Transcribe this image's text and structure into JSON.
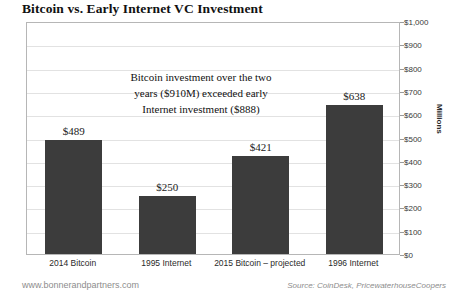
{
  "chart_data": {
    "type": "bar",
    "title": "Bitcoin vs. Early Internet VC Investment",
    "categories": [
      "2014 Bitcoin",
      "1995 Internet",
      "2015 Bitcoin – projected",
      "1996 Internet"
    ],
    "values": [
      489,
      250,
      421,
      638
    ],
    "value_labels": [
      "$489",
      "$250",
      "$421",
      "$638"
    ],
    "xlabel": "",
    "ylabel": "Millions",
    "ylim": [
      0,
      1000
    ],
    "ytick_labels": [
      "$0",
      "$100",
      "$200",
      "$300",
      "$400",
      "$500",
      "$600",
      "$700",
      "$800",
      "$900",
      "$1,000"
    ],
    "ytick_values": [
      0,
      100,
      200,
      300,
      400,
      500,
      600,
      700,
      800,
      900,
      1000
    ],
    "grid": true,
    "legend": "none",
    "bar_color": "#3c3c3c",
    "gridline_color": "#e2e2e2",
    "border_color": "#b6b6b6",
    "annotation": {
      "line1": "Bitcoin investment over the two",
      "line2": "years ($910M) exceeded early",
      "line3": "Internet investment ($888)"
    }
  },
  "footer": {
    "site": "www.bonnerandpartners.com",
    "source": "Source: CoinDesk, PricewaterhouseCoopers"
  }
}
